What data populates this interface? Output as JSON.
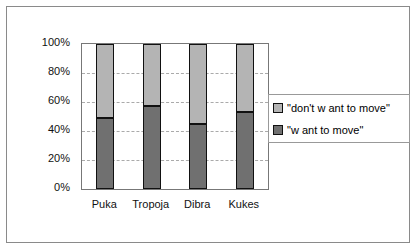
{
  "chart_data": {
    "type": "bar",
    "stacked": true,
    "percent": true,
    "categories": [
      "Puka",
      "Tropoja",
      "Dibra",
      "Kukes"
    ],
    "series": [
      {
        "name": "\"w ant to move\"",
        "values": [
          49,
          57,
          45,
          53
        ],
        "color": "#707070"
      },
      {
        "name": "\"don't w ant to move\"",
        "values": [
          51,
          43,
          55,
          47
        ],
        "color": "#b4b4b4"
      }
    ],
    "yticks": [
      "0%",
      "20%",
      "40%",
      "60%",
      "80%",
      "100%"
    ],
    "ylim": [
      0,
      100
    ],
    "grid": true,
    "legend_position": "right",
    "title": "",
    "xlabel": "",
    "ylabel": ""
  }
}
